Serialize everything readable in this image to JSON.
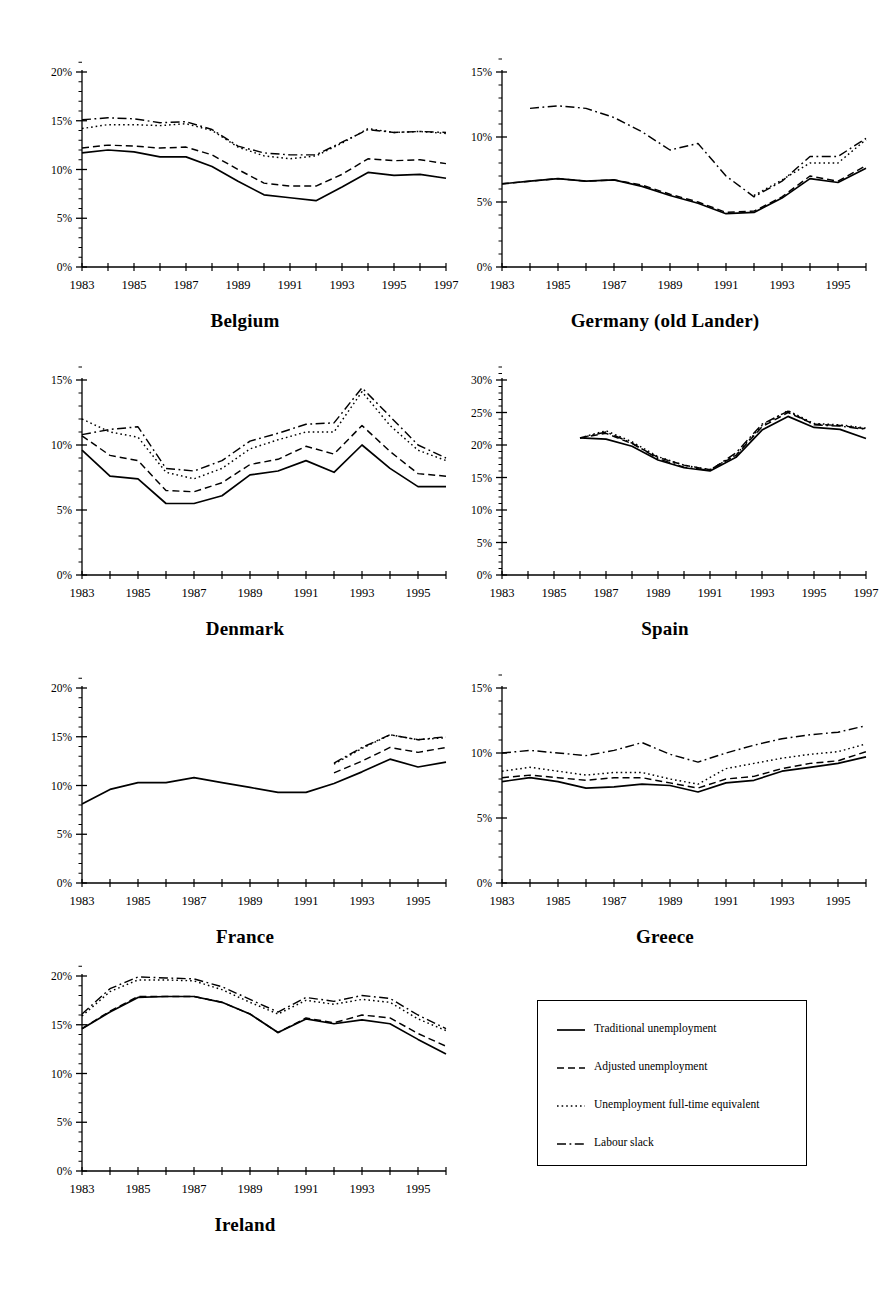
{
  "figure": {
    "kind": "small-multiples-line-charts",
    "panel_count": 7
  },
  "legend": {
    "items": [
      {
        "label": "Traditional unemployment",
        "style": "solid",
        "key": "traditional"
      },
      {
        "label": "Adjusted unemployment",
        "style": "dashed",
        "key": "adjusted"
      },
      {
        "label": "Unemployment full-time equivalent",
        "style": "dotted",
        "key": "fulltime"
      },
      {
        "label": "Labour slack",
        "style": "dash-dot",
        "key": "slack"
      }
    ]
  },
  "chart_data": [
    {
      "type": "line",
      "title": "Belgium",
      "xlabel": "",
      "ylabel": "",
      "ylim": [
        0,
        20
      ],
      "yticks": [
        0,
        5,
        10,
        15,
        20
      ],
      "ytick_labels": [
        "0%",
        "5%",
        "10%",
        "15%",
        "20%"
      ],
      "yminor_step": 1,
      "x": [
        1983,
        1984,
        1985,
        1986,
        1987,
        1988,
        1989,
        1990,
        1991,
        1992,
        1993,
        1994,
        1995,
        1996,
        1997
      ],
      "xtick_labels": [
        "1983",
        "",
        "1985",
        "",
        "1987",
        "",
        "1989",
        "",
        "1991",
        "",
        "1993",
        "",
        "1995",
        "",
        "1997"
      ],
      "grid": false,
      "legend_position": "none",
      "series": [
        {
          "name": "Traditional unemployment",
          "style": "solid",
          "values": [
            11.7,
            12.0,
            11.8,
            11.3,
            11.3,
            10.3,
            8.8,
            7.4,
            7.1,
            6.8,
            8.2,
            9.7,
            9.4,
            9.5,
            9.1
          ]
        },
        {
          "name": "Adjusted unemployment",
          "style": "dashed",
          "values": [
            12.2,
            12.5,
            12.4,
            12.2,
            12.3,
            11.5,
            10.0,
            8.6,
            8.3,
            8.3,
            9.5,
            11.1,
            10.9,
            11.0,
            10.6
          ]
        },
        {
          "name": "Unemployment full-time equivalent",
          "style": "dotted",
          "values": [
            14.2,
            14.6,
            14.6,
            14.5,
            14.7,
            14.0,
            12.3,
            11.4,
            11.1,
            11.4,
            12.7,
            14.2,
            13.8,
            13.9,
            13.7
          ]
        },
        {
          "name": "Labour slack",
          "style": "dash-dot",
          "values": [
            15.1,
            15.3,
            15.2,
            14.8,
            14.9,
            14.1,
            12.4,
            11.7,
            11.5,
            11.5,
            12.8,
            14.1,
            13.8,
            13.9,
            13.8
          ]
        }
      ]
    },
    {
      "type": "line",
      "title": "Germany (old Lander)",
      "xlabel": "",
      "ylabel": "",
      "ylim": [
        0,
        15
      ],
      "yticks": [
        0,
        5,
        10,
        15
      ],
      "ytick_labels": [
        "0%",
        "5%",
        "10%",
        "15%"
      ],
      "yminor_step": 1,
      "x": [
        1983,
        1984,
        1985,
        1986,
        1987,
        1988,
        1989,
        1990,
        1991,
        1992,
        1993,
        1994,
        1995,
        1996
      ],
      "xtick_labels": [
        "1983",
        "",
        "1985",
        "",
        "1987",
        "",
        "1989",
        "",
        "1991",
        "",
        "1993",
        "",
        "1995",
        ""
      ],
      "grid": false,
      "legend_position": "none",
      "series": [
        {
          "name": "Traditional unemployment",
          "style": "solid",
          "values": [
            6.4,
            6.6,
            6.8,
            6.6,
            6.7,
            6.2,
            5.5,
            4.9,
            4.1,
            4.2,
            5.3,
            6.8,
            6.5,
            7.6
          ]
        },
        {
          "name": "Adjusted unemployment",
          "style": "dashed",
          "values": [
            6.4,
            6.6,
            6.8,
            6.6,
            6.7,
            6.3,
            5.6,
            5.0,
            4.2,
            4.3,
            5.4,
            7.0,
            6.6,
            7.8
          ]
        },
        {
          "name": "Unemployment full-time equivalent",
          "style": "dotted",
          "values": [
            null,
            null,
            null,
            null,
            null,
            null,
            null,
            null,
            null,
            5.5,
            6.7,
            8.0,
            8.0,
            9.8
          ]
        },
        {
          "name": "Labour slack",
          "style": "dash-dot",
          "values": [
            null,
            12.2,
            12.4,
            12.2,
            11.5,
            10.4,
            9.0,
            9.5,
            7.0,
            5.4,
            6.6,
            8.5,
            8.5,
            9.9
          ]
        }
      ]
    },
    {
      "type": "line",
      "title": "Denmark",
      "xlabel": "",
      "ylabel": "",
      "ylim": [
        0,
        15
      ],
      "yticks": [
        0,
        5,
        10,
        15
      ],
      "ytick_labels": [
        "0%",
        "5%",
        "10%",
        "15%"
      ],
      "yminor_step": 1,
      "x": [
        1983,
        1984,
        1985,
        1986,
        1987,
        1988,
        1989,
        1990,
        1991,
        1992,
        1993,
        1994,
        1995,
        1996
      ],
      "xtick_labels": [
        "1983",
        "",
        "1985",
        "",
        "1987",
        "",
        "1989",
        "",
        "1991",
        "",
        "1993",
        "",
        "1995",
        ""
      ],
      "grid": false,
      "legend_position": "none",
      "series": [
        {
          "name": "Traditional unemployment",
          "style": "solid",
          "values": [
            9.6,
            7.6,
            7.4,
            5.5,
            5.5,
            6.1,
            7.7,
            8.0,
            8.8,
            7.9,
            10.0,
            8.2,
            6.8,
            6.8
          ]
        },
        {
          "name": "Adjusted unemployment",
          "style": "dashed",
          "values": [
            10.7,
            9.2,
            8.8,
            6.5,
            6.4,
            7.1,
            8.5,
            8.9,
            9.9,
            9.3,
            11.5,
            9.5,
            7.8,
            7.6
          ]
        },
        {
          "name": "Unemployment full-time equivalent",
          "style": "dotted",
          "values": [
            12.0,
            11.0,
            10.6,
            7.9,
            7.4,
            8.2,
            9.7,
            10.4,
            11.0,
            11.0,
            14.1,
            11.5,
            9.6,
            8.8
          ]
        },
        {
          "name": "Labour slack",
          "style": "dash-dot",
          "values": [
            10.8,
            11.2,
            11.4,
            8.2,
            8.0,
            8.8,
            10.3,
            10.9,
            11.6,
            11.7,
            14.4,
            12.2,
            10.0,
            9.0
          ]
        }
      ]
    },
    {
      "type": "line",
      "title": "Spain",
      "xlabel": "",
      "ylabel": "",
      "ylim": [
        0,
        30
      ],
      "yticks": [
        0,
        5,
        10,
        15,
        20,
        25,
        30
      ],
      "ytick_labels": [
        "0%",
        "5%",
        "10%",
        "15%",
        "20%",
        "25%",
        "30%"
      ],
      "yminor_step": 1,
      "x": [
        1983,
        1984,
        1985,
        1986,
        1987,
        1988,
        1989,
        1990,
        1991,
        1992,
        1993,
        1994,
        1995,
        1996,
        1997
      ],
      "xtick_labels": [
        "1983",
        "",
        "1985",
        "",
        "1987",
        "",
        "1989",
        "",
        "1991",
        "",
        "1993",
        "",
        "1995",
        "",
        "1997"
      ],
      "grid": false,
      "legend_position": "none",
      "series": [
        {
          "name": "Traditional unemployment",
          "style": "solid",
          "values": [
            null,
            null,
            null,
            21.1,
            20.9,
            19.8,
            17.7,
            16.5,
            16.0,
            18.1,
            22.3,
            24.4,
            22.7,
            22.4,
            21.0
          ]
        },
        {
          "name": "Adjusted unemployment",
          "style": "dashed",
          "values": [
            null,
            null,
            null,
            21.1,
            21.8,
            20.2,
            18.1,
            16.9,
            16.2,
            18.4,
            22.8,
            25.0,
            23.2,
            23.0,
            22.5
          ]
        },
        {
          "name": "Unemployment full-time equivalent",
          "style": "dotted",
          "values": [
            null,
            null,
            null,
            21.1,
            22.2,
            20.5,
            18.2,
            16.9,
            16.2,
            18.5,
            23.0,
            25.3,
            23.3,
            23.1,
            22.6
          ]
        },
        {
          "name": "Labour slack",
          "style": "dash-dot",
          "values": [
            null,
            null,
            null,
            21.1,
            22.0,
            20.3,
            17.9,
            16.6,
            16.1,
            18.8,
            23.2,
            25.2,
            23.1,
            22.9,
            22.4
          ]
        }
      ]
    },
    {
      "type": "line",
      "title": "France",
      "xlabel": "",
      "ylabel": "",
      "ylim": [
        0,
        20
      ],
      "yticks": [
        0,
        5,
        10,
        15,
        20
      ],
      "ytick_labels": [
        "0%",
        "5%",
        "10%",
        "15%",
        "20%"
      ],
      "yminor_step": 1,
      "x": [
        1983,
        1984,
        1985,
        1986,
        1987,
        1988,
        1989,
        1990,
        1991,
        1992,
        1993,
        1994,
        1995,
        1996
      ],
      "xtick_labels": [
        "1983",
        "",
        "1985",
        "",
        "1987",
        "",
        "1989",
        "",
        "1991",
        "",
        "1993",
        "",
        "1995",
        ""
      ],
      "grid": false,
      "legend_position": "none",
      "series": [
        {
          "name": "Traditional unemployment",
          "style": "solid",
          "values": [
            8.1,
            9.6,
            10.3,
            10.3,
            10.8,
            10.3,
            9.8,
            9.3,
            9.3,
            10.2,
            11.4,
            12.7,
            11.9,
            12.4
          ]
        },
        {
          "name": "Adjusted unemployment",
          "style": "dashed",
          "values": [
            null,
            null,
            null,
            null,
            null,
            null,
            null,
            null,
            null,
            11.3,
            12.5,
            13.9,
            13.4,
            13.9
          ]
        },
        {
          "name": "Unemployment full-time equivalent",
          "style": "dotted",
          "values": [
            null,
            null,
            null,
            null,
            null,
            null,
            null,
            null,
            null,
            12.2,
            13.8,
            15.2,
            14.7,
            14.9
          ]
        },
        {
          "name": "Labour slack",
          "style": "dash-dot",
          "values": [
            null,
            null,
            null,
            null,
            null,
            null,
            null,
            null,
            null,
            12.3,
            13.9,
            15.2,
            14.7,
            15.0
          ]
        }
      ]
    },
    {
      "type": "line",
      "title": "Greece",
      "xlabel": "",
      "ylabel": "",
      "ylim": [
        0,
        15
      ],
      "yticks": [
        0,
        5,
        10,
        15
      ],
      "ytick_labels": [
        "0%",
        "5%",
        "10%",
        "15%"
      ],
      "yminor_step": 1,
      "x": [
        1983,
        1984,
        1985,
        1986,
        1987,
        1988,
        1989,
        1990,
        1991,
        1992,
        1993,
        1994,
        1995,
        1996
      ],
      "xtick_labels": [
        "1983",
        "",
        "1985",
        "",
        "1987",
        "",
        "1989",
        "",
        "1991",
        "",
        "1993",
        "",
        "1995",
        ""
      ],
      "grid": false,
      "legend_position": "none",
      "series": [
        {
          "name": "Traditional unemployment",
          "style": "solid",
          "values": [
            7.8,
            8.1,
            7.8,
            7.3,
            7.4,
            7.6,
            7.5,
            7.0,
            7.7,
            7.9,
            8.6,
            8.9,
            9.2,
            9.7
          ]
        },
        {
          "name": "Adjusted unemployment",
          "style": "dashed",
          "values": [
            8.1,
            8.3,
            8.1,
            7.9,
            8.1,
            8.1,
            7.7,
            7.3,
            8.0,
            8.2,
            8.8,
            9.2,
            9.4,
            10.1
          ]
        },
        {
          "name": "Unemployment full-time equivalent",
          "style": "dotted",
          "values": [
            8.6,
            8.9,
            8.6,
            8.3,
            8.5,
            8.5,
            8.0,
            7.6,
            8.8,
            9.2,
            9.6,
            9.9,
            10.1,
            10.7
          ]
        },
        {
          "name": "Labour slack",
          "style": "dash-dot",
          "values": [
            10.0,
            10.2,
            10.0,
            9.8,
            10.2,
            10.8,
            9.9,
            9.3,
            10.0,
            10.6,
            11.1,
            11.4,
            11.6,
            12.1
          ]
        }
      ]
    },
    {
      "type": "line",
      "title": "Ireland",
      "xlabel": "",
      "ylabel": "",
      "ylim": [
        0,
        20
      ],
      "yticks": [
        0,
        5,
        10,
        15,
        20
      ],
      "ytick_labels": [
        "0%",
        "5%",
        "10%",
        "15%",
        "20%"
      ],
      "yminor_step": 1,
      "x": [
        1983,
        1984,
        1985,
        1986,
        1987,
        1988,
        1989,
        1990,
        1991,
        1992,
        1993,
        1994,
        1995,
        1996
      ],
      "xtick_labels": [
        "1983",
        "",
        "1985",
        "",
        "1987",
        "",
        "1989",
        "",
        "1991",
        "",
        "1993",
        "",
        "1995",
        ""
      ],
      "grid": false,
      "legend_position": "none",
      "series": [
        {
          "name": "Traditional unemployment",
          "style": "solid",
          "values": [
            14.6,
            16.3,
            17.8,
            17.9,
            17.9,
            17.3,
            16.1,
            14.2,
            15.6,
            15.1,
            15.5,
            15.1,
            13.5,
            12.0
          ]
        },
        {
          "name": "Adjusted unemployment",
          "style": "dashed",
          "values": [
            14.6,
            16.4,
            17.9,
            17.9,
            17.9,
            17.3,
            16.1,
            14.2,
            15.7,
            15.2,
            16.0,
            15.7,
            14.1,
            12.8
          ]
        },
        {
          "name": "Unemployment full-time equivalent",
          "style": "dotted",
          "values": [
            15.9,
            18.4,
            19.6,
            19.6,
            19.5,
            18.6,
            17.3,
            16.1,
            17.5,
            17.1,
            17.6,
            17.3,
            15.6,
            14.4
          ]
        },
        {
          "name": "Labour slack",
          "style": "dash-dot",
          "values": [
            16.1,
            18.7,
            19.9,
            19.8,
            19.7,
            18.9,
            17.6,
            16.3,
            17.8,
            17.4,
            18.0,
            17.7,
            16.0,
            14.6
          ]
        }
      ]
    }
  ],
  "layout": {
    "panels": [
      {
        "key": "belgium",
        "chart_index": 0,
        "left": 30,
        "top": 58
      },
      {
        "key": "germany",
        "chart_index": 1,
        "left": 450,
        "top": 58
      },
      {
        "key": "denmark",
        "chart_index": 2,
        "left": 30,
        "top": 366
      },
      {
        "key": "spain",
        "chart_index": 3,
        "left": 450,
        "top": 366
      },
      {
        "key": "france",
        "chart_index": 4,
        "left": 30,
        "top": 674
      },
      {
        "key": "greece",
        "chart_index": 5,
        "left": 450,
        "top": 674
      },
      {
        "key": "ireland",
        "chart_index": 6,
        "left": 30,
        "top": 962
      }
    ],
    "legend_box": {
      "left": 537,
      "top": 1000,
      "width": 270,
      "height": 166
    }
  }
}
